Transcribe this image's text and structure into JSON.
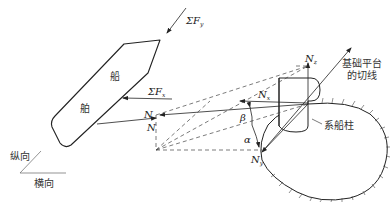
{
  "diagram": {
    "type": "force-decomposition",
    "left_panel": {
      "ship_labels": [
        "船",
        "舶"
      ],
      "forces": {
        "sum_fy": {
          "symbol": "ΣF",
          "sub": "y"
        },
        "sum_fx": {
          "symbol": "ΣF",
          "sub": "x"
        },
        "n": {
          "symbol": "N"
        }
      },
      "axes": {
        "longitudinal": "纵向",
        "transverse": "横向"
      }
    },
    "right_panel": {
      "n_label": "N",
      "nz": {
        "symbol": "N",
        "sub": "z"
      },
      "nx": {
        "symbol": "N",
        "sub": "x"
      },
      "ny": {
        "symbol": "N",
        "sub": "y"
      },
      "angle_beta": "β",
      "angle_alpha": "α",
      "tangent_label_line1": "基础平台",
      "tangent_label_line2": "的切线",
      "bollard_label": "系船柱"
    }
  }
}
